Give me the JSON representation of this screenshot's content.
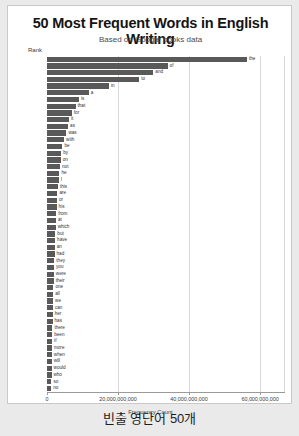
{
  "header": {
    "title": "50 Most Frequent Words in English Writing",
    "subtitle": "Based on Google books data"
  },
  "caption": "빈출 영단어 50개",
  "colors": {
    "bar": "#595959",
    "page_background": "#eaeaea",
    "card_background": "#ffffff",
    "grid": "#d8d8d8",
    "axis": "#9a9a9a"
  },
  "chart_data": {
    "type": "bar",
    "orientation": "horizontal",
    "title": "50 Most Frequent Words in English Writing",
    "subtitle": "Based on Google books data",
    "xlabel": "Frequency Count",
    "ylabel": "Rank",
    "xlim": [
      0,
      67000000000
    ],
    "xticks": [
      0,
      20000000000,
      40000000000,
      60000000000
    ],
    "xtick_labels": [
      "0",
      "20,000,000,000",
      "40,000,000,000",
      "60,000,000,000"
    ],
    "grid": true,
    "legend": false,
    "ranks": [
      1,
      2,
      3,
      4,
      5,
      6,
      7,
      8,
      9,
      10,
      11,
      12,
      13,
      14,
      15,
      16,
      17,
      18,
      19,
      20,
      21,
      22,
      23,
      24,
      25,
      26,
      27,
      28,
      29,
      30,
      31,
      32,
      33,
      34,
      35,
      36,
      37,
      38,
      39,
      40,
      41,
      42,
      43,
      44,
      45,
      46,
      47,
      48,
      49,
      50
    ],
    "categories": [
      "the",
      "of",
      "and",
      "to",
      "in",
      "a",
      "is",
      "that",
      "for",
      "it",
      "as",
      "was",
      "with",
      "be",
      "by",
      "on",
      "not",
      "he",
      "I",
      "this",
      "are",
      "or",
      "his",
      "from",
      "at",
      "which",
      "but",
      "have",
      "an",
      "had",
      "they",
      "you",
      "were",
      "their",
      "one",
      "all",
      "we",
      "can",
      "her",
      "has",
      "there",
      "been",
      "if",
      "more",
      "when",
      "will",
      "would",
      "who",
      "so",
      "no"
    ],
    "values": [
      56271872,
      33950064,
      29944184,
      25956096,
      17420636,
      11764797,
      9006601,
      8026283,
      6989050,
      6194851,
      5936790,
      5470009,
      4819000,
      4356000,
      4030000,
      3880000,
      3667000,
      3500000,
      3300000,
      3100000,
      2950000,
      2820000,
      2700000,
      2600000,
      2500000,
      2430000,
      2350000,
      2280000,
      2200000,
      2130000,
      2060000,
      1990000,
      1930000,
      1870000,
      1810000,
      1760000,
      1710000,
      1660000,
      1610000,
      1560000,
      1520000,
      1480000,
      1440000,
      1400000,
      1370000,
      1330000,
      1300000,
      1270000,
      1240000,
      1210000
    ],
    "value_scale_note": "values in thousands of occurrences (x1000)",
    "values_absolute": [
      56271872000,
      33950064000,
      29944184000,
      25956096000,
      17420636000,
      11764797000,
      9006601000,
      8026283000,
      6989050000,
      6194851000,
      5936790000,
      5470009000,
      4819000000,
      4356000000,
      4030000000,
      3880000000,
      3667000000,
      3500000000,
      3300000000,
      3100000000,
      2950000000,
      2820000000,
      2700000000,
      2600000000,
      2500000000,
      2430000000,
      2350000000,
      2280000000,
      2200000000,
      2130000000,
      2060000000,
      1990000000,
      1930000000,
      1870000000,
      1810000000,
      1760000000,
      1710000000,
      1660000000,
      1610000000,
      1560000000,
      1520000000,
      1480000000,
      1440000000,
      1400000000,
      1370000000,
      1330000000,
      1300000000,
      1270000000,
      1240000000,
      1210000000
    ]
  }
}
